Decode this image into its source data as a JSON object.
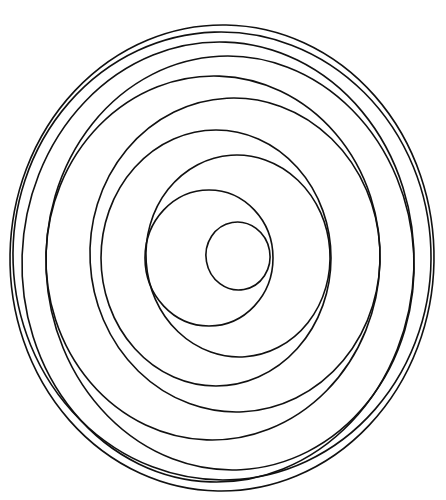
{
  "drawing": {
    "description": "Hand-drawn spiral of nested, off-center elliptical loops",
    "background": "#ffffff",
    "stroke_color": "#111111",
    "stroke_width": 1.6,
    "loops": [
      {
        "cx": 238,
        "cy": 256,
        "rx": 32,
        "ry": 34,
        "rotate": -10
      },
      {
        "cx": 209,
        "cy": 258,
        "rx": 64,
        "ry": 68,
        "rotate": 0
      },
      {
        "cx": 238,
        "cy": 256,
        "rx": 92,
        "ry": 101,
        "rotate": -4
      },
      {
        "cx": 216,
        "cy": 258,
        "rx": 115,
        "ry": 128,
        "rotate": 0
      },
      {
        "cx": 235,
        "cy": 255,
        "rx": 145,
        "ry": 157,
        "rotate": -3
      },
      {
        "cx": 213,
        "cy": 258,
        "rx": 167,
        "ry": 182,
        "rotate": 2
      },
      {
        "cx": 230,
        "cy": 263,
        "rx": 184,
        "ry": 207,
        "rotate": -3
      },
      {
        "cx": 218,
        "cy": 262,
        "rx": 196,
        "ry": 220,
        "rotate": 2
      },
      {
        "cx": 222,
        "cy": 256,
        "rx": 209,
        "ry": 224,
        "rotate": -2
      },
      {
        "cx": 222,
        "cy": 258,
        "rx": 212,
        "ry": 233,
        "rotate": 1
      }
    ]
  }
}
